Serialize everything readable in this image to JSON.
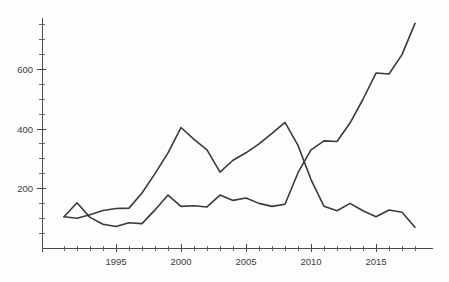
{
  "chart_data": {
    "type": "line",
    "title": "",
    "subtitle": "",
    "xlabel": "",
    "ylabel": "",
    "xlim": [
      1991,
      2018
    ],
    "ylim": [
      0,
      790
    ],
    "grid": false,
    "legend": "none",
    "background_color": "#fdfdfd",
    "line_color": "#3a3a3a",
    "axis_color": "#4a4a4a",
    "x": [
      1991,
      1992,
      1993,
      1994,
      1995,
      1996,
      1997,
      1998,
      1999,
      2000,
      2001,
      2002,
      2003,
      2004,
      2005,
      2006,
      2007,
      2008,
      2009,
      2010,
      2011,
      2012,
      2013,
      2014,
      2015,
      2016,
      2017,
      2018
    ],
    "xticks_major": [
      1995,
      2000,
      2005,
      2010,
      2015
    ],
    "xtick_labels": [
      "1995",
      "2000",
      "2005",
      "2010",
      "2015"
    ],
    "xticks_minor": [
      1991,
      1992,
      1993,
      1994,
      1996,
      1997,
      1998,
      1999,
      2001,
      2002,
      2003,
      2004,
      2006,
      2007,
      2008,
      2009,
      2011,
      2012,
      2013,
      2014,
      2016,
      2017,
      2018
    ],
    "yticks_major": [
      200,
      400,
      600
    ],
    "ytick_labels": [
      "200",
      "400",
      "600"
    ],
    "yticks_minor": [
      50,
      100,
      150,
      250,
      300,
      350,
      450,
      500,
      550,
      650,
      700,
      750
    ],
    "series": [
      {
        "name": "rising-series",
        "values": [
          105,
          100,
          112,
          126,
          133,
          134,
          185,
          250,
          320,
          405,
          365,
          330,
          255,
          295,
          320,
          350,
          385,
          422,
          345,
          230,
          140,
          125,
          150,
          125,
          105,
          128,
          120,
          70
        ]
      },
      {
        "name": "declining-series",
        "values": [
          105,
          152,
          103,
          80,
          72,
          85,
          82,
          128,
          178,
          140,
          142,
          138,
          178,
          160,
          168,
          150,
          140,
          147,
          253,
          330,
          360,
          358,
          420,
          500,
          588,
          585,
          650,
          755
        ]
      }
    ]
  }
}
